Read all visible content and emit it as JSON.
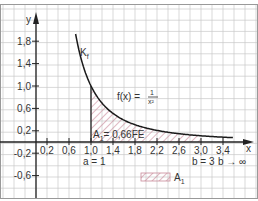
{
  "chart_data": {
    "type": "area",
    "title": "",
    "function_label": "f(x) = 1/x²",
    "function_num": "1",
    "function_den": "x²",
    "function_prefix": "f(x) =",
    "curve_label": "K",
    "curve_label_sub": "f",
    "xlabel": "x",
    "ylabel": "y",
    "xlim": [
      -0.6,
      4.0
    ],
    "ylim": [
      -0.9,
      2.1
    ],
    "x_ticks": [
      "0,2",
      "0,6",
      "1,0",
      "1,4",
      "1,8",
      "2,2",
      "2,6",
      "3,0",
      "3,4"
    ],
    "x_tick_values": [
      0.2,
      0.6,
      1.0,
      1.4,
      1.8,
      2.2,
      2.6,
      3.0,
      3.4
    ],
    "y_ticks": [
      "1,8",
      "1,4",
      "1,0",
      "0,6",
      "0,2",
      "-0,2",
      "-0,6"
    ],
    "y_tick_values": [
      1.8,
      1.4,
      1.0,
      0.6,
      0.2,
      -0.2,
      -0.6
    ],
    "grid": true,
    "shaded_region": {
      "from": 1,
      "to": 3,
      "area_label": "A",
      "area_sub": "1",
      "area_value": "= 0,66FE"
    },
    "annotations": {
      "a": "a = 1",
      "b": "b = 3",
      "b_limit": "b → ∞"
    },
    "legend": [
      {
        "label": "A",
        "sub": "1",
        "style": "hatched"
      }
    ],
    "curve_points_x": [
      0.72,
      0.8,
      0.9,
      1.0,
      1.2,
      1.4,
      1.6,
      1.8,
      2.0,
      2.4,
      2.8,
      3.2,
      3.6
    ],
    "curve_points_y": [
      1.93,
      1.56,
      1.23,
      1.0,
      0.69,
      0.51,
      0.39,
      0.31,
      0.25,
      0.17,
      0.13,
      0.1,
      0.08
    ]
  },
  "colors": {
    "grid": "#c8c8c8",
    "axis": "#222222",
    "curve": "#1a1a1a",
    "hatch": "#c98a9a",
    "frame": "#999999"
  }
}
